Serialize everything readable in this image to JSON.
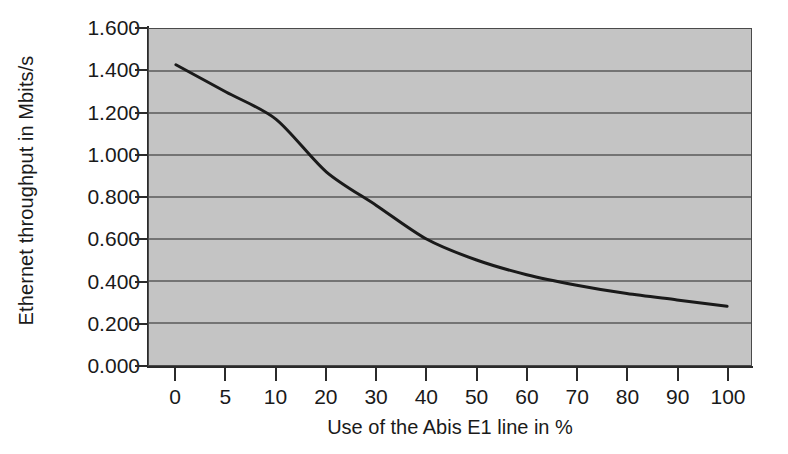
{
  "chart_data": {
    "type": "line",
    "title": "",
    "xlabel": "Use of the Abis E1 line in %",
    "ylabel": "Ethernet throughput in Mbits/s",
    "x": [
      0,
      5,
      10,
      20,
      30,
      40,
      50,
      60,
      70,
      80,
      90,
      100
    ],
    "values": [
      1.43,
      1.3,
      1.17,
      0.92,
      0.76,
      0.6,
      0.5,
      0.43,
      0.38,
      0.34,
      0.31,
      0.28
    ],
    "series": [
      {
        "name": "Ethernet throughput",
        "values": [
          1.43,
          1.3,
          1.17,
          0.92,
          0.76,
          0.6,
          0.5,
          0.43,
          0.38,
          0.34,
          0.31,
          0.28
        ]
      }
    ],
    "xtick_labels": [
      "0",
      "5",
      "10",
      "20",
      "30",
      "40",
      "50",
      "60",
      "70",
      "80",
      "90",
      "100"
    ],
    "ytick_labels": [
      "0.000",
      "0.200",
      "0.400",
      "0.600",
      "0.800",
      "1.000",
      "1.200",
      "1.400",
      "1.600"
    ],
    "ytick_values": [
      0.0,
      0.2,
      0.4,
      0.6,
      0.8,
      1.0,
      1.2,
      1.4,
      1.6
    ],
    "ylim": [
      0.0,
      1.6
    ],
    "xaxis_scale": "categorical-even-spacing",
    "grid": "horizontal",
    "legend": "none",
    "plot_background_color": "#c4c4c4",
    "line_color": "#1a1a1a",
    "gridline_color": "#5a5a5a",
    "axis_color": "#2b2b2b",
    "figure_background_color": "#ffffff"
  }
}
